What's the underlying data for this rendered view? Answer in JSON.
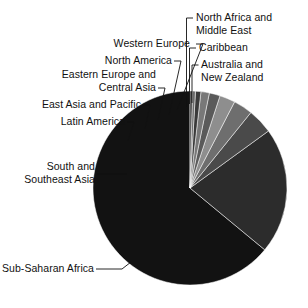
{
  "chart_data": {
    "type": "pie",
    "title": "",
    "subtitle": "",
    "xlabel": "",
    "ylabel": "",
    "legend_position": "callout-labels",
    "grid": false,
    "start_angle_deg": 0,
    "direction": "counterclockwise",
    "categories": [
      "Sub-Saharan Africa",
      "South and Southeast Asia",
      "Latin America",
      "East Asia and Pacific",
      "Eastern Europe and Central Asia",
      "North America",
      "Western Europe",
      "North Africa and Middle East",
      "Caribbean",
      "Australia and New Zealand"
    ],
    "values": [
      64.0,
      21.0,
      4.2,
      3.2,
      2.6,
      1.8,
      1.4,
      0.9,
      0.5,
      0.4
    ],
    "colors": [
      "#121212",
      "#2c2c2c",
      "#4a4a4a",
      "#6e6e6e",
      "#8e8e8e",
      "#5a5a5a",
      "#787878",
      "#3a3a3a",
      "#6a6a6a",
      "#303030"
    ],
    "slices": [
      {
        "label": "Sub-Saharan Africa",
        "value": 64.0,
        "color": "#121212"
      },
      {
        "label": "South and Southeast Asia",
        "value": 21.0,
        "color": "#2c2c2c"
      },
      {
        "label": "Latin America",
        "value": 4.2,
        "color": "#4a4a4a"
      },
      {
        "label": "East Asia and Pacific",
        "value": 3.2,
        "color": "#6e6e6e"
      },
      {
        "label": "Eastern Europe and Central Asia",
        "value": 2.6,
        "color": "#8e8e8e"
      },
      {
        "label": "North America",
        "value": 1.8,
        "color": "#5a5a5a"
      },
      {
        "label": "Western Europe",
        "value": 1.4,
        "color": "#787878"
      },
      {
        "label": "North Africa and Middle East",
        "value": 0.9,
        "color": "#3a3a3a"
      },
      {
        "label": "Caribbean",
        "value": 0.5,
        "color": "#6a6a6a"
      },
      {
        "label": "Australia and New Zealand",
        "value": 0.4,
        "color": "#303030"
      }
    ]
  },
  "labels": {
    "north_africa_line1": "North Africa and",
    "north_africa_line2": "Middle East",
    "caribbean": "Caribbean",
    "australia_line1": "Australia and",
    "australia_line2": "New Zealand",
    "western_europe": "Western Europe",
    "north_america": "North America",
    "eastern_europe_line1": "Eastern Europe and",
    "eastern_europe_line2": "Central Asia",
    "east_asia": "East Asia and Pacific",
    "latin_america": "Latin America",
    "south_asia_line1": "South and",
    "south_asia_line2": "Southeast Asia",
    "sub_saharan": "Sub-Saharan Africa"
  }
}
